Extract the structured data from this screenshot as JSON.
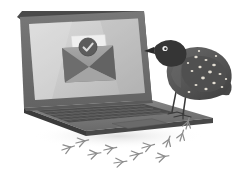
{
  "illustration": {
    "title": "Verified email on laptop with perched bird",
    "caption": "Grayscale illustration of an open laptop showing an opened envelope with a verified checkmark badge on its screen, a speckled quail-like bird perched on the laptop base, and three-toed bird footprints on the ground.",
    "style": "grayscale-flat-illustration",
    "background_color": "#ffffff"
  },
  "palette": {
    "background": "#ffffff",
    "lid_outer": "#6b6b6b",
    "lid_bezel": "#7a7a7a",
    "lid_edge_dark": "#4a4a4a",
    "screen_light": "#d5d5d5",
    "screen_mid": "#c2c2c2",
    "screen_dark": "#b2b2b2",
    "base_top": "#7d7d7d",
    "base_dark": "#4f4f4f",
    "base_side": "#3d3d3d",
    "key_dark": "#4c4c4c",
    "key_line": "#6f6f6f",
    "trackpad": "#6e6e6e",
    "envelope_body": "#9a9a9a",
    "envelope_flap": "#6f6f6f",
    "envelope_card": "#efefef",
    "badge_circle": "#5c5c5c",
    "badge_check": "#d8d8d8",
    "bird_head": "#3a3a3a",
    "bird_body": "#5a5a5a",
    "bird_body_dark": "#454545",
    "bird_spot": "#e2ddd2",
    "bird_eye": "#f2f2f2",
    "bird_beak": "#2e2e2e",
    "bird_leg": "#3a3a3a",
    "footprint": "#8d8d8d",
    "shadow": "#e3e3e3"
  },
  "scene": {
    "laptop": {
      "name": "laptop",
      "screen": {
        "name": "laptop-screen",
        "content_name": "email-verified-graphic"
      },
      "keyboard": {
        "name": "laptop-keyboard",
        "key_rows": 4,
        "keys_per_row": 13
      },
      "trackpad": {
        "name": "laptop-trackpad"
      }
    },
    "envelope": {
      "name": "open-envelope",
      "badge": {
        "name": "verified-check-badge",
        "glyph": "check"
      }
    },
    "bird": {
      "name": "quail-bird",
      "facing": "left",
      "spot_count": 17,
      "legs": 2,
      "perched_on": "laptop-base"
    },
    "footprints": {
      "name": "bird-footprints",
      "count": 11,
      "toes_per_print": 3
    },
    "shadow": {
      "name": "ground-shadow"
    }
  }
}
